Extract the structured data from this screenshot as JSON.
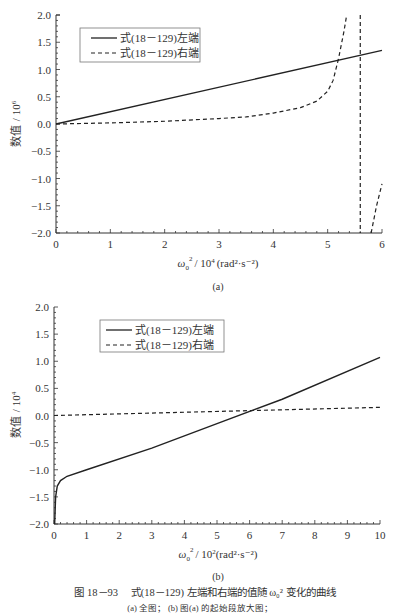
{
  "chart_data": [
    {
      "type": "line",
      "panel": "(a)",
      "xlabel": "ω0² / 10⁴ (rad²·s⁻²)",
      "ylabel": "数值 / 10⁶",
      "xlim": [
        0,
        6
      ],
      "ylim": [
        -2.0,
        2.0
      ],
      "xticks": [
        "0",
        "1",
        "2",
        "3",
        "4",
        "5",
        "6"
      ],
      "yticks": [
        "2.0",
        "1.5",
        "1.0",
        "0.5",
        "0.0",
        "-0.5",
        "-1.0",
        "-1.5",
        "-2.0"
      ],
      "legend_position": "upper left",
      "grid": false,
      "series": [
        {
          "name": "式(18－129)左端",
          "style": "solid",
          "x": [
            0,
            6
          ],
          "y": [
            0.0,
            1.35
          ]
        },
        {
          "name": "式(18－129)右端",
          "style": "dashed",
          "x": [
            0,
            1,
            2,
            3,
            3.5,
            4,
            4.5,
            4.8,
            5.0,
            5.1,
            5.2,
            5.3,
            5.35
          ],
          "y": [
            0.0,
            0.02,
            0.05,
            0.1,
            0.13,
            0.2,
            0.3,
            0.42,
            0.6,
            0.8,
            1.2,
            1.7,
            2.0
          ],
          "asymptote_x": 5.6,
          "branch2": {
            "x": [
              5.8,
              5.9,
              6.0
            ],
            "y": [
              -2.0,
              -1.5,
              -1.1
            ]
          }
        }
      ]
    },
    {
      "type": "line",
      "panel": "(b)",
      "xlabel": "ω0² / 10²(rad²·s⁻²)",
      "ylabel": "数值 / 10⁴",
      "xlim": [
        0,
        10
      ],
      "ylim": [
        -2.0,
        2.0
      ],
      "xticks": [
        "0",
        "1",
        "2",
        "3",
        "4",
        "5",
        "6",
        "7",
        "8",
        "9",
        "10"
      ],
      "yticks": [
        "2.0",
        "1.5",
        "1.0",
        "0.5",
        "0.0",
        "-0.5",
        "-1.0",
        "-1.5",
        "-2.0"
      ],
      "legend_position": "upper left",
      "grid": false,
      "series": [
        {
          "name": "式(18－129)左端",
          "style": "solid",
          "x": [
            0.02,
            0.05,
            0.1,
            0.2,
            0.4,
            1,
            3,
            5,
            7,
            10
          ],
          "y": [
            -2.0,
            -1.5,
            -1.3,
            -1.2,
            -1.12,
            -1.0,
            -0.6,
            -0.15,
            0.3,
            1.07
          ]
        },
        {
          "name": "式(18－129)右端",
          "style": "dashed",
          "x": [
            0,
            10
          ],
          "y": [
            0.0,
            0.15
          ]
        }
      ]
    }
  ],
  "panel_a": {
    "ylabel_main": "数值",
    "ylabel_unit": "/ 10",
    "ylabel_exp": "6",
    "xlabel_main": "ω",
    "xlabel_sub": "0",
    "xlabel_rest": "/ 10",
    "xlabel_exp": "4",
    "xlabel_units": "(rad²·s⁻²)",
    "panel_label": "(a)",
    "legend": [
      "式(18－129)左端",
      "式(18－129)右端"
    ],
    "xticks": [
      "0",
      "1",
      "2",
      "3",
      "4",
      "5",
      "6"
    ],
    "yticks": [
      "2.0",
      "1.5",
      "1.0",
      "0.5",
      "0.0",
      "−0.5",
      "−1.0",
      "−1.5",
      "−2.0"
    ]
  },
  "panel_b": {
    "ylabel_main": "数值",
    "ylabel_unit": "/ 10",
    "ylabel_exp": "4",
    "xlabel_main": "ω",
    "xlabel_sub": "0",
    "xlabel_rest": "/ 10",
    "xlabel_exp": "2",
    "xlabel_units": "(rad²·s⁻²)",
    "panel_label": "(b)",
    "legend": [
      "式(18－129)左端",
      "式(18－129)右端"
    ],
    "xticks": [
      "0",
      "1",
      "2",
      "3",
      "4",
      "5",
      "6",
      "7",
      "8",
      "9",
      "10"
    ],
    "yticks": [
      "2.0",
      "1.5",
      "1.0",
      "0.5",
      "0.0",
      "−0.5",
      "−1.0",
      "−1.5",
      "−2.0"
    ]
  },
  "caption": {
    "title": "图 18－93　 式(18－129) 左端和右端的值随 ω₀² 变化的曲线",
    "subtitle": "(a) 全图；  (b) 图(a) 的起始段放大图；"
  }
}
